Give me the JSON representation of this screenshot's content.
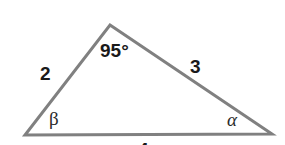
{
  "figure": {
    "type": "triangle-diagram",
    "background_color": "#ffffff",
    "stroke_color": "#808080",
    "stroke_width": 3,
    "text_color": "#1a1a1a",
    "vertices": {
      "apex": {
        "x": 110,
        "y": 25
      },
      "bottom_left": {
        "x": 25,
        "y": 135
      },
      "bottom_right": {
        "x": 272,
        "y": 134
      }
    },
    "labels": {
      "apex_angle": "95°",
      "side_left": "2",
      "side_right": "3",
      "angle_bottom_left": "β",
      "angle_bottom_right": "α",
      "side_base": "4"
    }
  }
}
